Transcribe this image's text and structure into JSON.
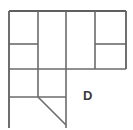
{
  "figure": {
    "type": "line-diagram",
    "width": 133,
    "height": 130,
    "background_color": "#ffffff",
    "stroke_color": "#6b6b6b",
    "labels": [
      {
        "id": "label-d",
        "text": "D",
        "x": 83,
        "y": 89,
        "font_size": 13,
        "color": "#3a3a3a"
      }
    ],
    "segments": {
      "horizontals": [
        {
          "id": "top-edge",
          "x1": 9,
          "x2": 126,
          "y": 11
        },
        {
          "id": "mid-left-upper",
          "x1": 9,
          "x2": 38,
          "y": 44
        },
        {
          "id": "mid-right-upper",
          "x1": 95,
          "x2": 126,
          "y": 44
        },
        {
          "id": "mid-full",
          "x1": 9,
          "x2": 126,
          "y": 69
        },
        {
          "id": "lower-left",
          "x1": 9,
          "x2": 66,
          "y": 97
        }
      ],
      "verticals": [
        {
          "id": "left-edge",
          "x": 9,
          "y1": 11,
          "y2": 128
        },
        {
          "id": "inner-left",
          "x": 38,
          "y1": 11,
          "y2": 97
        },
        {
          "id": "inner-center",
          "x": 66,
          "y1": 11,
          "y2": 128
        },
        {
          "id": "inner-right",
          "x": 95,
          "y1": 11,
          "y2": 69
        },
        {
          "id": "right-edge",
          "x": 126,
          "y1": 11,
          "y2": 69
        }
      ],
      "diagonals": [
        {
          "id": "diagonal-dc",
          "x1": 38,
          "y1": 97,
          "x2": 66,
          "y2": 125
        }
      ]
    }
  }
}
